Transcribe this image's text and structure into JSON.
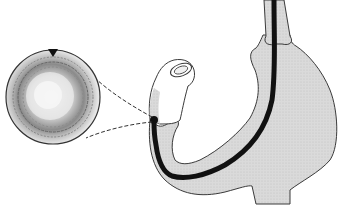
{
  "figure": {
    "colors": {
      "background": "#ffffff",
      "organ_fill": "#d9d9d9",
      "outline": "#3a3a3a",
      "endoscope": "#111111",
      "inset_dark": "#555555"
    },
    "parts": [
      "stomach",
      "esophagus",
      "duodenum",
      "endoscope",
      "magnified-view-inset",
      "view-pointer-lines",
      "orientation-marker"
    ]
  }
}
